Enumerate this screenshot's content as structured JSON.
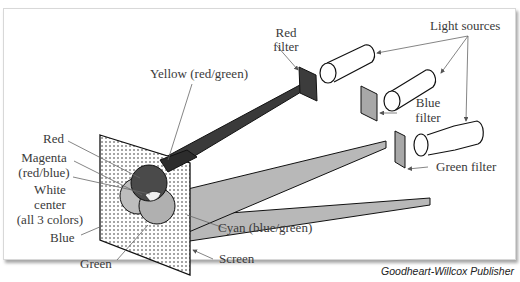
{
  "figure": {
    "labels": {
      "red_filter": [
        "Red",
        "filter"
      ],
      "light_sources": "Light sources",
      "yellow": "Yellow (red/green)",
      "blue_filter": [
        "Blue",
        "filter"
      ],
      "red": "Red",
      "magenta": [
        "Magenta",
        "(red/blue)"
      ],
      "white_center": [
        "White",
        "center",
        "(all 3 colors)"
      ],
      "blue": "Blue",
      "green": "Green",
      "green_filter": "Green filter",
      "cyan": "Cyan (blue/green)",
      "screen": "Screen"
    },
    "credit": "Goodheart-Willcox Publisher",
    "colors": {
      "red_beam": "#3a3a3a",
      "blue_beam": "#b4b4b4",
      "green_beam": "#b4b4b4",
      "filter_red": "#3c3c3c",
      "filter_gray": "#a8a8a8"
    }
  }
}
